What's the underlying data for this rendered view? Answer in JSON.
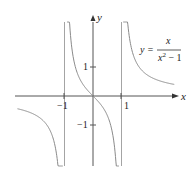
{
  "chart_data": {
    "type": "line",
    "title": "",
    "function": "y = x/(x^2 - 1)",
    "xlabel": "x",
    "ylabel": "y",
    "x_ticks": [
      -1,
      1
    ],
    "x_tick_labels": [
      "−1",
      "1"
    ],
    "y_ticks": [
      1,
      -1
    ],
    "y_tick_labels": [
      "1",
      "−1"
    ],
    "vertical_asymptotes": [
      -1,
      1
    ],
    "horizontal_asymptote": 0,
    "xlim": [
      -2.7,
      2.9
    ],
    "ylim": [
      -2.4,
      2.6
    ],
    "grid": false,
    "annotation": {
      "lhs": "y =",
      "numerator": "x",
      "denominator_base": "x",
      "denominator_exp": "2",
      "denominator_rest": " − 1"
    },
    "series": [
      {
        "name": "branch-left",
        "domain": [
          -2.65,
          -1.06
        ]
      },
      {
        "name": "branch-middle",
        "domain": [
          -0.91,
          0.91
        ]
      },
      {
        "name": "branch-right",
        "domain": [
          1.06,
          2.85
        ]
      }
    ],
    "colors": {
      "curve": "#8a8a8a",
      "axis": "#555555",
      "asymptote": "#9a9a9a"
    }
  }
}
